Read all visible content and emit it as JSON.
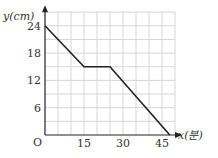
{
  "chart_data": {
    "type": "line",
    "title": "",
    "xlabel": "x(분)",
    "ylabel": "y(cm)",
    "origin_label": "O",
    "x_ticks": [
      15,
      30,
      45
    ],
    "y_ticks": [
      6,
      12,
      18,
      24
    ],
    "xlim": [
      0,
      50
    ],
    "ylim": [
      0,
      27
    ],
    "grid": {
      "on": true,
      "x_step": 5,
      "y_step": 3
    },
    "series": [
      {
        "name": "y",
        "points": [
          [
            0,
            24
          ],
          [
            15,
            15
          ],
          [
            25,
            15
          ],
          [
            48,
            0
          ]
        ]
      }
    ],
    "colors": {
      "line": "#222222",
      "grid": "#d6d6d6",
      "axis": "#222222"
    }
  }
}
